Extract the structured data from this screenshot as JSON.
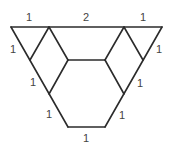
{
  "diagram": {
    "colors": {
      "stroke": "#2b2b2b",
      "label": "#444444",
      "background": "#ffffff"
    },
    "labels": {
      "top_left": "1",
      "top_middle": "2",
      "top_right": "1",
      "left_upper": "1",
      "right_upper": "1",
      "left_middle": "1",
      "right_middle": "1",
      "left_lower": "1",
      "right_lower": "1",
      "bottom": "1"
    }
  }
}
